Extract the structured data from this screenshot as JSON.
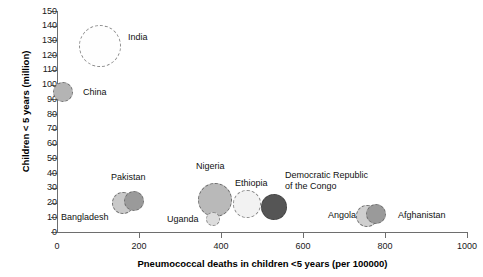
{
  "chart_data": {
    "type": "scatter",
    "title": "",
    "xlabel": "Pneumococcal deaths in children <5 years (per 100000)",
    "ylabel": "Children < 5 years (million)",
    "xlim": [
      0,
      1000
    ],
    "ylim": [
      0,
      150
    ],
    "xticks": [
      0,
      200,
      400,
      600,
      800,
      1000
    ],
    "xtick_labels": [
      "0",
      "200",
      "400",
      "600",
      "800",
      "1000"
    ],
    "yticks": [
      0,
      10,
      20,
      30,
      40,
      50,
      60,
      70,
      80,
      90,
      100,
      110,
      120,
      130,
      140,
      150
    ],
    "ytick_labels": [
      "0",
      "10",
      "20",
      "30",
      "40",
      "50",
      "60",
      "70",
      "80",
      "90",
      "100",
      "110",
      "120",
      "130",
      "140",
      "150"
    ],
    "grid": false,
    "legend": "none",
    "bubble_note": "Bubble area encodes number of pneumococcal deaths; dashed outlines, grayscale fills",
    "points": [
      {
        "label": "India",
        "x": 105,
        "y": 126,
        "radius_px": 21,
        "fill": "#fefefe",
        "stroke": "#8a8a8a",
        "label_x": 128,
        "label_y": 32
      },
      {
        "label": "China",
        "x": 15,
        "y": 95,
        "radius_px": 10,
        "fill": "#b4b4b4",
        "stroke": "#6b6b6b",
        "label_x": 83,
        "label_y": 87
      },
      {
        "label": "Bangladesh",
        "x": 160,
        "y": 20,
        "radius_px": 11,
        "fill": "#c9c9c9",
        "stroke": "#707070",
        "label_x": 61,
        "label_y": 212
      },
      {
        "label": "Pakistan",
        "x": 188,
        "y": 21,
        "radius_px": 10,
        "fill": "#9a9a9a",
        "stroke": "#6b6b6b",
        "label_x": 111,
        "label_y": 172
      },
      {
        "label": "Nigeria",
        "x": 385,
        "y": 22,
        "radius_px": 17,
        "fill": "#b9b9b9",
        "stroke": "#6b6b6b",
        "label_x": 196,
        "label_y": 161
      },
      {
        "label": "Uganda",
        "x": 380,
        "y": 9,
        "radius_px": 7,
        "fill": "#dcdcdc",
        "stroke": "#8a8a8a",
        "label_x": 167,
        "label_y": 214
      },
      {
        "label": "Ethiopia",
        "x": 463,
        "y": 19,
        "radius_px": 14,
        "fill": "#f2f2f2",
        "stroke": "#8a8a8a",
        "label_x": 235,
        "label_y": 178
      },
      {
        "label": "Democratic Republic\nof the Congo",
        "x": 530,
        "y": 17,
        "radius_px": 13,
        "fill": "#555555",
        "stroke": "#3d3d3d",
        "label_x": 285,
        "label_y": 170
      },
      {
        "label": "Angola",
        "x": 755,
        "y": 11,
        "radius_px": 11,
        "fill": "#cfcfcf",
        "stroke": "#707070",
        "label_x": 328,
        "label_y": 210
      },
      {
        "label": "Afghanistan",
        "x": 777,
        "y": 12,
        "radius_px": 10,
        "fill": "#9a9a9a",
        "stroke": "#6b6b6b",
        "label_x": 398,
        "label_y": 210
      }
    ]
  }
}
